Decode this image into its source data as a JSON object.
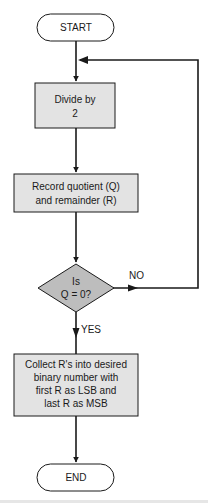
{
  "diagram": {
    "type": "flowchart",
    "colors": {
      "process_fill": "#e3e3e3",
      "decision_fill": "#bdbdbd",
      "terminator_fill": "#ffffff",
      "stroke": "#1a1a1a"
    },
    "nodes": {
      "start": {
        "label": "START",
        "shape": "terminator"
      },
      "divide": {
        "lines": [
          "Divide by",
          "2"
        ],
        "shape": "process"
      },
      "record": {
        "lines": [
          "Record quotient (Q)",
          "and remainder (R)"
        ],
        "shape": "process"
      },
      "decision": {
        "lines": [
          "Is",
          "Q = 0?"
        ],
        "shape": "decision"
      },
      "collect": {
        "lines": [
          "Collect R's into desired",
          "binary number with",
          "first R as LSB and",
          "last R as MSB"
        ],
        "shape": "process"
      },
      "end": {
        "label": "END",
        "shape": "terminator"
      }
    },
    "edge_labels": {
      "no": "NO",
      "yes": "YES"
    },
    "edges": [
      {
        "from": "start",
        "to": "divide"
      },
      {
        "from": "divide",
        "to": "record"
      },
      {
        "from": "record",
        "to": "decision"
      },
      {
        "from": "decision",
        "to": "divide",
        "label": "NO"
      },
      {
        "from": "decision",
        "to": "collect",
        "label": "YES"
      },
      {
        "from": "collect",
        "to": "end"
      }
    ]
  }
}
